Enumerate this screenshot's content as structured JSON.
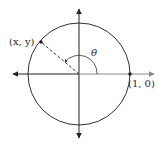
{
  "diagram": {
    "labels": {
      "point_xy": "(x, y)",
      "point_10": "(1, 0)",
      "angle": "θ"
    },
    "geometry": {
      "center": [
        79,
        74
      ],
      "radius": 51,
      "point_xy": [
        41,
        42
      ],
      "point_10": [
        130,
        74
      ]
    },
    "colors": {
      "stroke": "#333333",
      "axis_right": "#777777",
      "background": "#ffffff"
    }
  }
}
